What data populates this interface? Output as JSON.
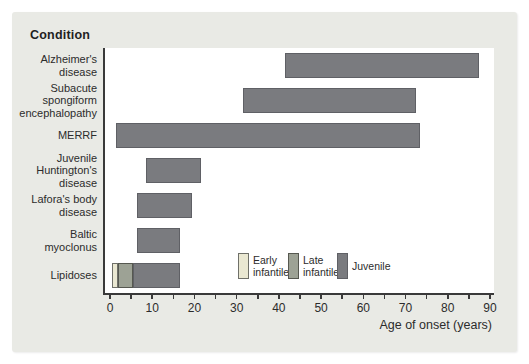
{
  "figure": {
    "header": "Condition",
    "x_axis_label": "Age of onset (years)"
  },
  "chart_data": {
    "type": "bar",
    "orientation": "horizontal_range",
    "title": "",
    "xlabel": "Age of onset (years)",
    "ylabel": "Condition",
    "xlim": [
      0,
      92
    ],
    "x_major_ticks": [
      0,
      10,
      20,
      30,
      40,
      50,
      60,
      70,
      80,
      90
    ],
    "x_minor_tick_step": 5,
    "grid": false,
    "legend_position": "inside-bottom",
    "phases": {
      "early_infantile": {
        "label": "Early infantile",
        "fill": "#eae8d2",
        "border": "#6f7069"
      },
      "late_infantile": {
        "label": "Late infantile",
        "fill": "#9da295",
        "border": "#565850"
      },
      "juvenile": {
        "label": "Juvenile",
        "fill": "#7a7b7f",
        "border": "#5f6065"
      }
    },
    "bars": [
      {
        "condition": "Alzheimer's disease",
        "label_lines": [
          "Alzheimer's",
          "disease"
        ],
        "segments": [
          {
            "phase": "juvenile",
            "start": 41,
            "end": 87
          }
        ]
      },
      {
        "condition": "Subacute spongiform encephalopathy",
        "label_lines": [
          "Subacute",
          "spongiform",
          "encephalopathy"
        ],
        "segments": [
          {
            "phase": "juvenile",
            "start": 31,
            "end": 72
          }
        ]
      },
      {
        "condition": "MERRF",
        "label_lines": [
          "MERRF"
        ],
        "segments": [
          {
            "phase": "juvenile",
            "start": 1,
            "end": 73
          }
        ]
      },
      {
        "condition": "Juvenile Huntington's disease",
        "label_lines": [
          "Juvenile",
          "Huntington's",
          "disease"
        ],
        "segments": [
          {
            "phase": "juvenile",
            "start": 8,
            "end": 21
          }
        ]
      },
      {
        "condition": "Lafora's body disease",
        "label_lines": [
          "Lafora's body",
          "disease"
        ],
        "segments": [
          {
            "phase": "juvenile",
            "start": 6,
            "end": 19
          }
        ]
      },
      {
        "condition": "Baltic myoclonus",
        "label_lines": [
          "Baltic",
          "myoclonus"
        ],
        "segments": [
          {
            "phase": "juvenile",
            "start": 6,
            "end": 16
          }
        ]
      },
      {
        "condition": "Lipidoses",
        "label_lines": [
          "Lipidoses"
        ],
        "segments": [
          {
            "phase": "early_infantile",
            "start": 0,
            "end": 1.5
          },
          {
            "phase": "late_infantile",
            "start": 1.5,
            "end": 5
          },
          {
            "phase": "juvenile",
            "start": 5,
            "end": 16
          }
        ]
      }
    ],
    "legend": [
      {
        "phase": "early_infantile",
        "label_lines": [
          "Early",
          "infantile"
        ]
      },
      {
        "phase": "late_infantile",
        "label_lines": [
          "Late",
          "infantile"
        ]
      },
      {
        "phase": "juvenile",
        "label_lines": [
          "Juvenile"
        ]
      }
    ]
  },
  "colors": {
    "page_background": "#ffffff",
    "panel_background": "#e9eae5",
    "plot_background": "#ffffff",
    "axis": "#3a3a3a",
    "text": "#2c2c2c"
  }
}
